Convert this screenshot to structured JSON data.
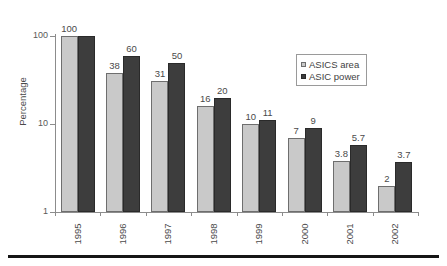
{
  "chart_data": {
    "type": "bar",
    "title": "",
    "xlabel": "",
    "ylabel": "Percentage",
    "yscale": "log",
    "ylim": [
      1,
      100
    ],
    "yticks": [
      100,
      10,
      1
    ],
    "ytick_labels": [
      "100",
      "10",
      "1"
    ],
    "grid": false,
    "legend_position": "upper right",
    "categories": [
      "1995",
      "1996",
      "1997",
      "1998",
      "1999",
      "2000",
      "2001",
      "2002"
    ],
    "series": [
      {
        "name": "ASICS area",
        "color": "#c9c9c9",
        "values": [
          100,
          38,
          31,
          16,
          10,
          7,
          3.8,
          2
        ],
        "labels": [
          "100",
          "38",
          "31",
          "16",
          "10",
          "7",
          "3.8",
          "2"
        ]
      },
      {
        "name": "ASIC power",
        "color": "#3d3d3d",
        "values": [
          100,
          60,
          50,
          20,
          11,
          9,
          5.7,
          3.7
        ],
        "labels": [
          "",
          "60",
          "50",
          "20",
          "11",
          "9",
          "5.7",
          "3.7"
        ]
      }
    ]
  },
  "axes": {
    "y_title": "Percentage",
    "y_ticks": [
      {
        "label": "100",
        "value": 100
      },
      {
        "label": "10",
        "value": 10
      },
      {
        "label": "1",
        "value": 1
      }
    ],
    "x_labels": [
      "1995",
      "1996",
      "1997",
      "1998",
      "1999",
      "2000",
      "2001",
      "2002"
    ]
  },
  "legend": {
    "items": [
      {
        "label": "ASICS area",
        "swatch": "light-gray-square",
        "color": "#c9c9c9"
      },
      {
        "label": "ASIC power",
        "swatch": "dark-square",
        "color": "#3d3d3d"
      }
    ]
  },
  "colors": {
    "series_area": "#c9c9c9",
    "series_power": "#3d3d3d",
    "axis": "#8c8c8c",
    "text": "#4a4a4a",
    "rule": "#151515",
    "background": "#ffffff"
  }
}
